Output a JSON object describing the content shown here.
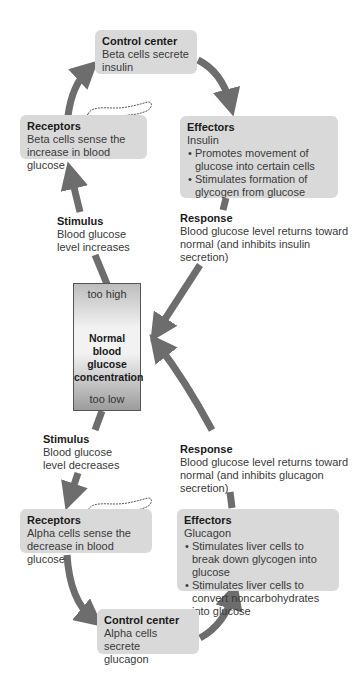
{
  "top_loop": {
    "control_center": {
      "title": "Control center",
      "lines": [
        "Beta cells secrete",
        "insulin"
      ]
    },
    "receptors": {
      "title": "Receptors",
      "lines": [
        "Beta cells sense the",
        "increase in blood glucose"
      ]
    },
    "effectors": {
      "title": "Effectors",
      "subtitle": "Insulin",
      "bullets": [
        "• Promotes movement of glucose into certain cells",
        "• Stimulates formation of glycogen from glucose"
      ]
    },
    "stimulus": {
      "title": "Stimulus",
      "lines": [
        "Blood glucose",
        "level increases"
      ]
    },
    "response": {
      "title": "Response",
      "lines": [
        "Blood glucose level returns toward",
        "normal (and inhibits insulin",
        "secretion)"
      ]
    }
  },
  "gauge": {
    "top_label": "too high",
    "center_lines": [
      "Normal",
      "blood glucose",
      "concentration"
    ],
    "bottom_label": "too low"
  },
  "bottom_loop": {
    "stimulus": {
      "title": "Stimulus",
      "lines": [
        "Blood glucose",
        "level decreases"
      ]
    },
    "response": {
      "title": "Response",
      "lines": [
        "Blood glucose level returns toward",
        "normal (and inhibits glucagon",
        "secretion)"
      ]
    },
    "receptors": {
      "title": "Receptors",
      "lines": [
        "Alpha cells sense the",
        "decrease in blood glucose"
      ]
    },
    "effectors": {
      "title": "Effectors",
      "subtitle": "Glucagon",
      "bullets": [
        "• Stimulates liver cells to break down glycogen into glucose",
        "• Stimulates liver cells to convert noncarbohydrates into glucose"
      ]
    },
    "control_center": {
      "title": "Control center",
      "lines": [
        "Alpha cells secrete",
        "glucagon"
      ]
    }
  },
  "icons": {
    "pancreas": "pancreas-icon",
    "arrow": "curved-arrow-icon"
  },
  "colors": {
    "box_fill": "#d9d9d9",
    "arrow": "#6d6d6d",
    "text": "#3a3a3a"
  }
}
